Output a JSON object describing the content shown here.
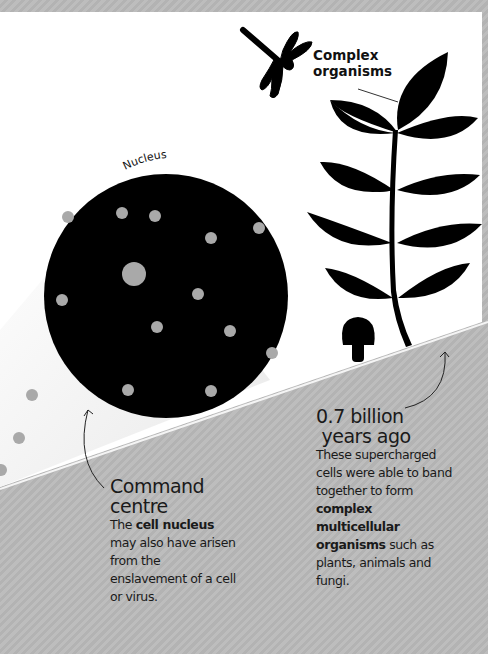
{
  "labels": {
    "complex_organisms_line1": "Complex",
    "complex_organisms_line2": "organisms",
    "nucleus": "Nucleus"
  },
  "command_centre": {
    "heading_line1": "Command",
    "heading_line2": "centre",
    "text_pre": "The ",
    "text_bold": "cell nucleus",
    "text_post": " may also have arisen from the enslavement of a cell or virus."
  },
  "billion_years": {
    "heading_line1": "0.7 billion",
    "heading_line2": " years ago",
    "text_pre": "These supercharged cells were able to band together to form ",
    "text_bold": "complex multicellular organisms",
    "text_post": " such as plants, animals and fungi."
  },
  "icons": [
    "dragonfly-icon",
    "fern-plant-icon",
    "mushroom-icon",
    "nucleus-circle",
    "arrow-icon"
  ],
  "colors": {
    "white_panel": "#ffffff",
    "gray_panel": "#b8b8b8",
    "black": "#000000",
    "dot": "#a9a9a9"
  }
}
